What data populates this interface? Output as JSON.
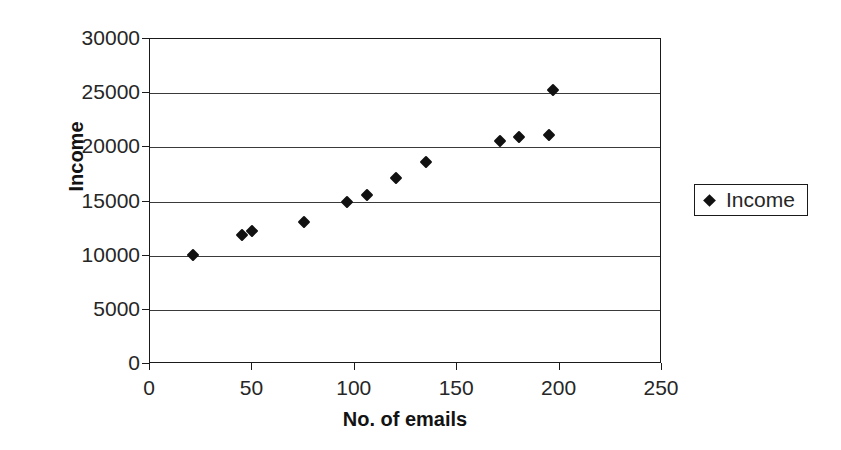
{
  "chart_data": {
    "type": "scatter",
    "title": "",
    "xlabel": "No. of emails",
    "ylabel": "Income",
    "xlim": [
      0,
      250
    ],
    "ylim": [
      0,
      30000
    ],
    "xticks": [
      0,
      50,
      100,
      150,
      200,
      250
    ],
    "yticks": [
      0,
      5000,
      10000,
      15000,
      20000,
      25000,
      30000
    ],
    "xtick_labels": [
      "0",
      "50",
      "100",
      "150",
      "200",
      "250"
    ],
    "ytick_labels": [
      "0",
      "5000",
      "10000",
      "15000",
      "20000",
      "25000",
      "30000"
    ],
    "grid": "horizontal",
    "legend_position": "right",
    "marker": "diamond",
    "marker_color": "#111111",
    "series": [
      {
        "name": "Income",
        "points": [
          {
            "x": 21,
            "y": 10050
          },
          {
            "x": 45,
            "y": 11950
          },
          {
            "x": 50,
            "y": 12300
          },
          {
            "x": 75,
            "y": 13100
          },
          {
            "x": 96,
            "y": 14950
          },
          {
            "x": 106,
            "y": 15600
          },
          {
            "x": 120,
            "y": 17200
          },
          {
            "x": 135,
            "y": 18650
          },
          {
            "x": 171,
            "y": 20600
          },
          {
            "x": 180,
            "y": 20950
          },
          {
            "x": 195,
            "y": 21150
          },
          {
            "x": 197,
            "y": 25300
          }
        ]
      }
    ]
  },
  "legend": {
    "entries": [
      {
        "label": "Income",
        "marker": "diamond-marker",
        "color": "#111111"
      }
    ]
  },
  "axes": {
    "x_title": "No. of emails",
    "y_title": "Income"
  }
}
